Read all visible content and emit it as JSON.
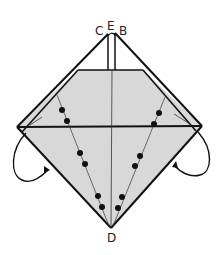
{
  "diagram": {
    "type": "origami-fold-step",
    "labels": {
      "c": "C",
      "e": "E",
      "b": "B",
      "d": "D"
    },
    "colors": {
      "paper_fill": "#d8d8d8",
      "line": "#111111",
      "background": "#ffffff"
    },
    "elements": [
      "outer diamond outline",
      "shaded inner kite",
      "horizontal fold line",
      "vertical center crease",
      "two dotted valley-fold lines to D",
      "two curved fold-behind arrows"
    ]
  }
}
